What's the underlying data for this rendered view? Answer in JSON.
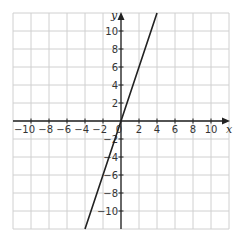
{
  "chart_data": {
    "type": "line",
    "title": "",
    "xlabel": "x",
    "ylabel": "y",
    "xlim": [
      -12,
      12
    ],
    "ylim": [
      -12,
      12
    ],
    "grid": true,
    "grid_step": 2,
    "x_ticks": [
      -10,
      -8,
      -6,
      -4,
      -2,
      0,
      2,
      4,
      6,
      8,
      10
    ],
    "y_ticks": [
      -10,
      -8,
      -6,
      -4,
      -2,
      2,
      4,
      6,
      8,
      10
    ],
    "x_tick_labels": [
      "−10",
      "−8",
      "−6",
      "−4",
      "−2",
      "0",
      "2",
      "4",
      "6",
      "8",
      "10"
    ],
    "y_tick_labels": [
      "−10",
      "−8",
      "−6",
      "−4",
      "−2",
      "2",
      "4",
      "6",
      "8",
      "10"
    ],
    "series": [
      {
        "name": "y = 3x",
        "x": [
          -4,
          -2,
          0,
          2,
          4
        ],
        "y": [
          -12,
          -6,
          0,
          6,
          12
        ]
      }
    ],
    "origin_label": "0",
    "colors": {
      "grid": "#d0d0d0",
      "axis": "#222222",
      "line": "#222222"
    }
  }
}
